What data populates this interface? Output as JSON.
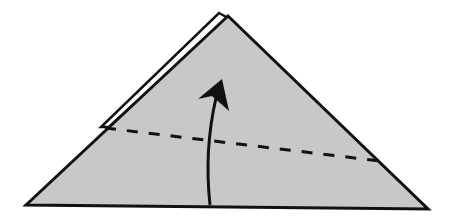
{
  "diagram": {
    "type": "origami-fold-step",
    "description": "Valley fold: fold the bottom edge of the triangle upward along the dashed line",
    "colors": {
      "paper_fill": "#c8c8c8",
      "back_layer_fill": "#ffffff",
      "outline": "#111111",
      "background": "#ffffff"
    },
    "shapes": {
      "main_triangle": {
        "apex": [
          228,
          16
        ],
        "left": [
          25,
          205
        ],
        "right": [
          428,
          209
        ]
      },
      "back_layer": {
        "apex": [
          219,
          13
        ],
        "points": [
          [
            219,
            13
          ],
          [
            228,
            17
          ],
          [
            106,
            127
          ],
          [
            100,
            127
          ]
        ]
      },
      "fold_line": {
        "style": "dashed",
        "from": [
          105,
          128
        ],
        "to": [
          380,
          161
        ]
      },
      "arrow": {
        "from": [
          210,
          204
        ],
        "to": [
          222,
          80
        ],
        "direction": "up",
        "curved": true
      }
    },
    "labels": []
  }
}
